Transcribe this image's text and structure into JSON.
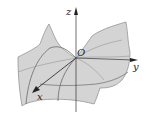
{
  "figure": {
    "type": "3d-surface-saddle",
    "axes": {
      "x_label": "x",
      "y_label": "y",
      "z_label": "z",
      "origin_label": "O"
    },
    "colors": {
      "surface_fill": "#d4d4d4",
      "surface_edge": "#8a8a8a",
      "grid_lines": "#6a6a6a",
      "axis": "#333333",
      "background": "#ffffff"
    }
  }
}
